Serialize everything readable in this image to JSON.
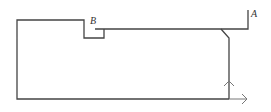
{
  "diagram": {
    "type": "turned-part-profile",
    "labels": {
      "point_a": "A",
      "point_b": "B"
    },
    "colors": {
      "line": "#444444",
      "axis": "#777777"
    },
    "axes": {
      "x_axis": "horizontal arrow at right-bottom",
      "z_axis": "vertical arrow at right-bottom"
    }
  }
}
